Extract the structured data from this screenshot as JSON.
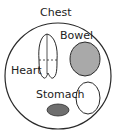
{
  "diagram": {
    "title": "Chest",
    "labels": {
      "bowel": "Bowel",
      "heart": "Heart",
      "stomach": "Stomach"
    },
    "colors": {
      "outline": "#2a2a2a",
      "bowel_fill": "#a9a9a9",
      "stomach_fill": "#6e6e6e",
      "empty_fill": "#ffffff"
    }
  }
}
